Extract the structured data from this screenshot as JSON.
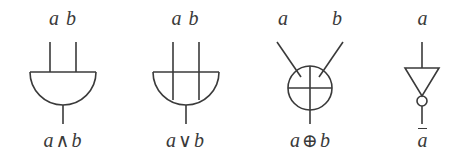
{
  "figure": {
    "caption_present": false,
    "stroke_color": "#3a3a3a",
    "background_color": "#ffffff",
    "gates": [
      {
        "id": "and-gate",
        "symbol_name": "and-gate-symbol",
        "inputs": [
          {
            "name": "input-a",
            "label": "a"
          },
          {
            "name": "input-b",
            "label": "b"
          }
        ],
        "output_label_operand_left": "a",
        "output_label_operator": "∧",
        "output_label_operand_right": "b",
        "output_label_full": "a ∧ b"
      },
      {
        "id": "or-gate",
        "symbol_name": "or-gate-symbol",
        "inputs": [
          {
            "name": "input-a",
            "label": "a"
          },
          {
            "name": "input-b",
            "label": "b"
          }
        ],
        "output_label_operand_left": "a",
        "output_label_operator": "∨",
        "output_label_operand_right": "b",
        "output_label_full": "a ∨ b"
      },
      {
        "id": "xor-gate",
        "symbol_name": "xor-gate-symbol",
        "inputs": [
          {
            "name": "input-a",
            "label": "a"
          },
          {
            "name": "input-b",
            "label": "b"
          }
        ],
        "output_label_operand_left": "a",
        "output_label_operator": "⊕",
        "output_label_operand_right": "b",
        "output_label_full": "a ⊕ b"
      },
      {
        "id": "not-gate",
        "symbol_name": "not-gate-symbol",
        "inputs": [
          {
            "name": "input-a",
            "label": "a"
          }
        ],
        "output_label_operand_left": "a",
        "output_label_operator": "",
        "output_label_operand_right": "",
        "output_label_full": "ā"
      }
    ]
  }
}
